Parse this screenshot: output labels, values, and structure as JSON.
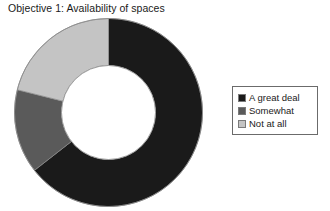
{
  "chart_title": "Objective 1: Availability of spaces",
  "chart_data": {
    "type": "pie",
    "variant": "donut",
    "title": "Objective 1: Availability of spaces",
    "xlabel": "",
    "ylabel": "",
    "categories": [
      "A great deal",
      "Somewhat",
      "Not at all"
    ],
    "values": [
      64.5,
      14.5,
      21.0
    ],
    "units": "percent",
    "start_angle_deg": 0,
    "direction": "clockwise",
    "inner_radius_ratio": 0.5,
    "grid": false,
    "legend_position": "right",
    "slices": [
      {
        "label": "A great deal",
        "value": 64.5,
        "color": "#1a1a1a",
        "start_deg": 0,
        "end_deg": 232
      },
      {
        "label": "Somewhat",
        "value": 14.5,
        "color": "#5a5a5a",
        "start_deg": 232,
        "end_deg": 284
      },
      {
        "label": "Not at all",
        "value": 21.0,
        "color": "#c4c4c4",
        "start_deg": 284,
        "end_deg": 360
      }
    ]
  },
  "legend": {
    "items": [
      {
        "label": "A great deal",
        "color": "#1a1a1a"
      },
      {
        "label": "Somewhat",
        "color": "#5a5a5a"
      },
      {
        "label": "Not at all",
        "color": "#c4c4c4"
      }
    ]
  },
  "colors": {
    "a_great_deal": "#1a1a1a",
    "somewhat": "#5a5a5a",
    "not_at_all": "#c4c4c4",
    "background": "#ffffff",
    "outline": "#6b6b6b",
    "text": "#1a1a1a"
  }
}
